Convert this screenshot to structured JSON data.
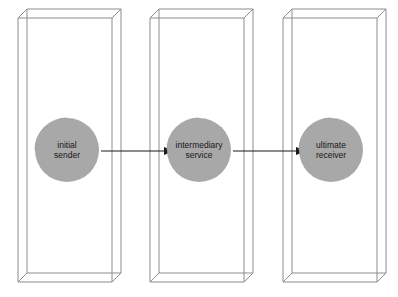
{
  "diagram": {
    "canvas": {
      "width": 398,
      "height": 297,
      "background": "#ffffff"
    },
    "style": {
      "box_stroke": "#8c8c8c",
      "box_fill": "#ffffff",
      "node_fill": "#a8a8a8",
      "node_rim": "#9a9a9a",
      "arrow_color": "#1a1a1a",
      "label_color": "#171717"
    },
    "nodes": [
      {
        "id": "initial-sender",
        "label_line1": "initial",
        "label_line2": "sender",
        "cx": 67,
        "cy": 150,
        "r": 32
      },
      {
        "id": "intermediary-service",
        "label_line1": "intermediary",
        "label_line2": "service",
        "cx": 199,
        "cy": 150,
        "r": 32
      },
      {
        "id": "ultimate-receiver",
        "label_line1": "ultimate",
        "label_line2": "receiver",
        "cx": 331,
        "cy": 150,
        "r": 32
      }
    ],
    "containers": [
      {
        "id": "container-initial-sender",
        "front_x": 18,
        "front_y": 18,
        "front_w": 94,
        "front_h": 264,
        "depth_x": 9,
        "depth_y": -9
      },
      {
        "id": "container-intermediary-service",
        "front_x": 150,
        "front_y": 18,
        "front_w": 94,
        "front_h": 264,
        "depth_x": 9,
        "depth_y": -9
      },
      {
        "id": "container-ultimate-receiver",
        "front_x": 283,
        "front_y": 18,
        "front_w": 94,
        "front_h": 264,
        "depth_x": 9,
        "depth_y": -9
      }
    ],
    "arrows": [
      {
        "id": "arrow-sender-to-intermediary",
        "x1": 101,
        "y1": 151,
        "x2": 166,
        "y2": 151
      },
      {
        "id": "arrow-intermediary-to-receiver",
        "x1": 233,
        "y1": 151,
        "x2": 298,
        "y2": 151
      }
    ]
  }
}
